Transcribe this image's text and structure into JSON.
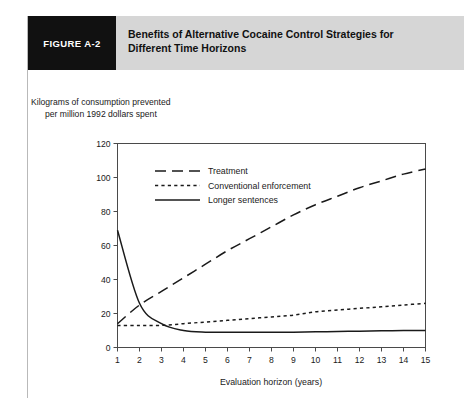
{
  "header": {
    "figure_tag": "FIGURE A-2",
    "title_line_1": "Benefits of Alternative Cocaine Control Strategies for",
    "title_line_2": "Different Time Horizons",
    "tag_bg_color": "#111111",
    "banner_bg_color": "#d6d6d6"
  },
  "axis_caption": {
    "line_1": "Kilograms of consumption prevented",
    "line_2": "per million 1992 dollars spent"
  },
  "chart_data": {
    "type": "line",
    "title": "Benefits of Alternative Cocaine Control Strategies for Different Time Horizons",
    "xlabel": "Evaluation horizon (years)",
    "ylabel": "Kilograms of consumption prevented per million 1992 dollars spent",
    "x": [
      1,
      2,
      3,
      4,
      5,
      6,
      7,
      8,
      9,
      10,
      11,
      12,
      13,
      14,
      15
    ],
    "xlim": [
      1,
      15
    ],
    "ylim": [
      0,
      120
    ],
    "xticks": [
      1,
      2,
      3,
      4,
      5,
      6,
      7,
      8,
      9,
      10,
      11,
      12,
      13,
      14,
      15
    ],
    "yticks": [
      0,
      20,
      40,
      60,
      80,
      100,
      120
    ],
    "xtick_labels": [
      "1",
      "2",
      "3",
      "4",
      "5",
      "6",
      "7",
      "8",
      "9",
      "10",
      "11",
      "12",
      "13",
      "14",
      "15"
    ],
    "ytick_labels": [
      "0",
      "20",
      "40",
      "60",
      "80",
      "100",
      "120"
    ],
    "grid": false,
    "legend_position": "upper-left-inside",
    "series": [
      {
        "name": "Treatment",
        "style": "dashed",
        "color": "#1a1a1a",
        "values": [
          14,
          25,
          33,
          41,
          49,
          57,
          64,
          71,
          78,
          84,
          89,
          94,
          98,
          102,
          105
        ]
      },
      {
        "name": "Conventional enforcement",
        "style": "dotted",
        "color": "#1a1a1a",
        "values": [
          13,
          13,
          13,
          14,
          15,
          16,
          17,
          18,
          19,
          21,
          22,
          23,
          24,
          25,
          26
        ]
      },
      {
        "name": "Longer sentences",
        "style": "solid",
        "color": "#1a1a1a",
        "values": [
          69,
          26,
          14,
          10,
          9,
          9,
          9,
          9,
          9,
          9.2,
          9.4,
          9.6,
          9.8,
          10,
          10
        ]
      }
    ]
  }
}
